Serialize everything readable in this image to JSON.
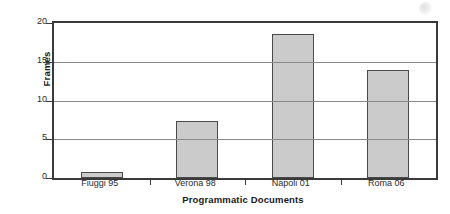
{
  "chart_data": {
    "type": "bar",
    "title": "",
    "xlabel": "Programmatic Documents",
    "ylabel": "Frames",
    "categories": [
      "Fiuggi 95",
      "Verona 98",
      "Napoli 01",
      "Roma 06"
    ],
    "values": [
      0.8,
      7.3,
      18.6,
      13.9
    ],
    "series": [
      {
        "name": "Frames",
        "values": [
          0.8,
          7.3,
          18.6,
          13.9
        ]
      }
    ],
    "ylim": [
      0,
      20
    ],
    "yticks": [
      0,
      5,
      10,
      15,
      20
    ],
    "ytick_labels": [
      "0",
      "5",
      "10",
      "15",
      "20"
    ],
    "grid": "horizontal",
    "legend": "none",
    "bar_fill_color": "#cbcbcb",
    "bar_border_color": "#4a4a4a",
    "axis_color": "#3a3a3a",
    "gridline_color": "#8a8a8a",
    "background_color": "#ffffff"
  }
}
